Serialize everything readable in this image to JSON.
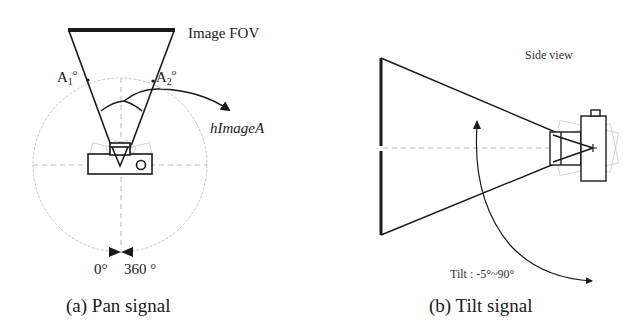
{
  "panel_a": {
    "caption": "(a) Pan signal",
    "fov_label": "Image FOV",
    "angle_left": "A",
    "angle_left_sub": "1",
    "angle_right": "A",
    "angle_right_sub": "2",
    "degree_symbol": "o",
    "angle_name": "hImageA",
    "pan_start": "0°",
    "pan_end": "360 °"
  },
  "panel_b": {
    "caption": "(b) Tilt signal",
    "view_label": "Side view",
    "tilt_range": "Tilt : -5°~90°"
  },
  "colors": {
    "line": "#1a1a1a",
    "guide": "#bbbbbb",
    "ghost": "#cccccc"
  }
}
